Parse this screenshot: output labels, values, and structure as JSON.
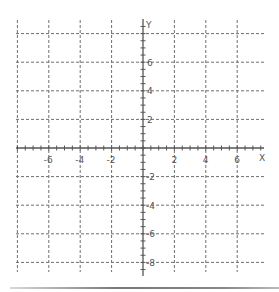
{
  "chart_data": {
    "type": "grid",
    "title": "",
    "xlabel": "X",
    "ylabel": "Y",
    "xlim": [
      -8,
      8
    ],
    "ylim": [
      -8,
      8
    ],
    "grid": true,
    "grid_style": "dashed",
    "grid_spacing": 2,
    "minor_tick_spacing": 0.5,
    "x_tick_labels": [
      "-6",
      "-4",
      "-2",
      "2",
      "4",
      "6"
    ],
    "x_tick_values": [
      -6,
      -4,
      -2,
      2,
      4,
      6
    ],
    "y_tick_labels": [
      "6",
      "4",
      "2",
      "-2",
      "-4",
      "-6",
      "-8"
    ],
    "y_tick_values": [
      6,
      4,
      2,
      -2,
      -4,
      -6,
      -8
    ],
    "series": []
  },
  "axes": {
    "x_label": "X",
    "y_label": "Y"
  },
  "colors": {
    "grid": "#6f6f6f",
    "axis": "#555555",
    "label": "#555555",
    "divider": "#8a8a8a"
  }
}
